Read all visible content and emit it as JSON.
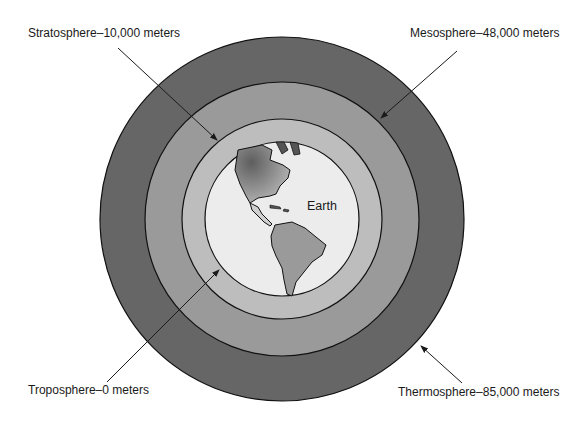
{
  "diagram": {
    "type": "concentric-layers",
    "center_label": "Earth",
    "layers": [
      {
        "name": "Troposphere",
        "altitude": "0 meters",
        "label": "Troposphere–0 meters",
        "fill": "#d6d6d6"
      },
      {
        "name": "Stratosphere",
        "altitude": "10,000 meters",
        "label": "Stratosphere–10,000 meters",
        "fill": "#bcbcbc"
      },
      {
        "name": "Mesosphere",
        "altitude": "48,000 meters",
        "label": "Mesosphere–48,000 meters",
        "fill": "#9c9c9c"
      },
      {
        "name": "Thermosphere",
        "altitude": "85,000 meters",
        "label": "Thermosphere–85,000 meters",
        "fill": "#6a6a6a"
      }
    ],
    "earth_fill": "#ececec",
    "land_fill": "#8a8a8a"
  }
}
